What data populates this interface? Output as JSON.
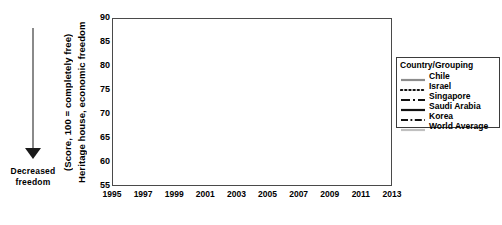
{
  "annotation": {
    "arrow_label_line1": "Decreased",
    "arrow_label_line2": "freedom",
    "arrow_icon": "down-arrow-icon",
    "arrow_color": "#8a8a8a"
  },
  "axis": {
    "ytitle_line1": "Heritage house, economic  freedom",
    "ytitle_line2": "(Score, 100 = completely  free)"
  },
  "legend": {
    "title": "Country/Grouping",
    "position": "right"
  },
  "chart_data": {
    "type": "line",
    "title": "",
    "xlabel": "",
    "ylabel": "Heritage house, economic freedom (Score, 100 = completely free)",
    "xlim": [
      1995,
      2013
    ],
    "ylim": [
      55,
      90
    ],
    "yticks": [
      55,
      60,
      65,
      70,
      75,
      80,
      85,
      90
    ],
    "xticks": [
      1995,
      1997,
      1999,
      2001,
      2003,
      2005,
      2007,
      2009,
      2011,
      2013
    ],
    "xtick_labels": [
      "1995",
      "1997",
      "1999",
      "2001",
      "2003",
      "2005",
      "2007",
      "2009",
      "2011",
      "2013"
    ],
    "grid": "horizontal-light",
    "x": [
      1995,
      1996,
      1997,
      1998,
      1999,
      2000,
      2001,
      2002,
      2003,
      2004,
      2005,
      2006,
      2007,
      2008,
      2009,
      2010,
      2011,
      2012,
      2013
    ],
    "series": [
      {
        "name": "Chile",
        "color": "#8c8c8c",
        "style": "solid",
        "width": 2.2,
        "values": [
          71.2,
          71.5,
          74.2,
          76.0,
          74.5,
          74.0,
          74.3,
          75.0,
          76.9,
          78.2,
          77.3,
          77.1,
          77.8,
          78.4,
          78.2,
          77.3,
          77.2,
          78.3,
          79.3
        ]
      },
      {
        "name": "Israel",
        "color": "#111111",
        "style": "dotted",
        "width": 2.0,
        "values": [
          60.8,
          61.0,
          61.3,
          61.7,
          62.3,
          63.0,
          66.8,
          67.8,
          66.3,
          64.0,
          64.8,
          65.2,
          63.6,
          64.0,
          66.2,
          67.5,
          68.5,
          69.4,
          69.0
        ]
      },
      {
        "name": "Singapore",
        "color": "#111111",
        "style": "dashdot-long",
        "width": 2.0,
        "values": [
          86.3,
          86.5,
          86.9,
          86.6,
          86.2,
          86.4,
          87.0,
          87.4,
          88.0,
          88.6,
          88.9,
          88.5,
          87.9,
          87.4,
          87.1,
          86.1,
          87.2,
          87.5,
          88.0
        ]
      },
      {
        "name": "Saudi Arabia",
        "color": "#111111",
        "style": "solid",
        "width": 2.2,
        "values": [
          68.3,
          68.5,
          69.1,
          67.5,
          66.5,
          64.0,
          65.8,
          63.4,
          62.9,
          60.4,
          61.7,
          62.8,
          62.2,
          61.0,
          62.5,
          64.1,
          64.5,
          66.2,
          62.5
        ]
      },
      {
        "name": "Korea",
        "color": "#111111",
        "style": "dashdot-short",
        "width": 2.2,
        "values": [
          71.5,
          70.5,
          69.0,
          72.0,
          73.0,
          69.3,
          68.6,
          68.9,
          67.5,
          67.3,
          66.4,
          67.1,
          68.2,
          68.7,
          68.3,
          69.9,
          70.3,
          70.6,
          70.8
        ]
      },
      {
        "name": "World  Average",
        "color": "#c0c0c0",
        "style": "solid",
        "width": 2.0,
        "values": [
          57.2,
          57.1,
          57.2,
          57.3,
          57.4,
          58.0,
          58.6,
          59.0,
          59.2,
          59.3,
          59.4,
          59.3,
          59.2,
          59.3,
          59.4,
          59.5,
          59.5,
          59.6,
          59.7
        ]
      }
    ]
  }
}
